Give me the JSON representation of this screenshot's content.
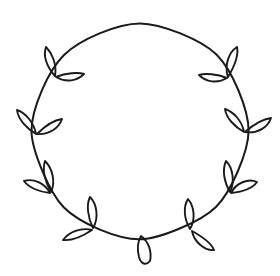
{
  "artwork": {
    "title": "Leaf Wreath",
    "type": "line-art-clipart",
    "subject": "circular vine wreath with leaf pairs",
    "style": "hand-drawn single-weight outline",
    "background_color": "#ffffff",
    "stroke_color": "#1a1a1a",
    "stroke_width": 2,
    "canvas": {
      "width": 280,
      "height": 276
    }
  },
  "wreath": {
    "ring": {
      "name": "vine-ring",
      "center_x": 140,
      "center_y": 131,
      "radius": 107,
      "closed": true
    },
    "cluster_count": 10,
    "leaf_count": 19,
    "clusters": [
      {
        "id": "cluster-upper-left",
        "label": "Upper left leaf pair",
        "angle_deg": 215,
        "anchor_x": 52,
        "anchor_y": 72,
        "leaves": 2
      },
      {
        "id": "cluster-left",
        "label": "Left leaf pair",
        "angle_deg": 180,
        "anchor_x": 34,
        "anchor_y": 133,
        "leaves": 2
      },
      {
        "id": "cluster-lower-left",
        "label": "Lower left leaf pair",
        "angle_deg": 145,
        "anchor_x": 50,
        "anchor_y": 193,
        "leaves": 2
      },
      {
        "id": "cluster-bottom-left",
        "label": "Bottom left leaf pair",
        "angle_deg": 115,
        "anchor_x": 92,
        "anchor_y": 229,
        "leaves": 2
      },
      {
        "id": "cluster-bottom-center",
        "label": "Bottom center single leaf",
        "angle_deg": 90,
        "anchor_x": 142,
        "anchor_y": 240,
        "leaves": 1
      },
      {
        "id": "cluster-bottom-right",
        "label": "Bottom right leaf pair",
        "angle_deg": 65,
        "anchor_x": 191,
        "anchor_y": 231,
        "leaves": 2
      },
      {
        "id": "cluster-lower-right",
        "label": "Lower right leaf pair",
        "angle_deg": 35,
        "anchor_x": 231,
        "anchor_y": 194,
        "leaves": 2
      },
      {
        "id": "cluster-right",
        "label": "Right leaf pair",
        "angle_deg": 0,
        "anchor_x": 247,
        "anchor_y": 131,
        "leaves": 2
      },
      {
        "id": "cluster-upper-right",
        "label": "Upper right leaf pair",
        "angle_deg": 325,
        "anchor_x": 230,
        "anchor_y": 74,
        "leaves": 2
      },
      {
        "id": "cluster-top-right-inner",
        "label": "Upper right inner leaf pair",
        "angle_deg": 300,
        "anchor_x": 0,
        "anchor_y": 0,
        "leaves": 0
      }
    ]
  }
}
